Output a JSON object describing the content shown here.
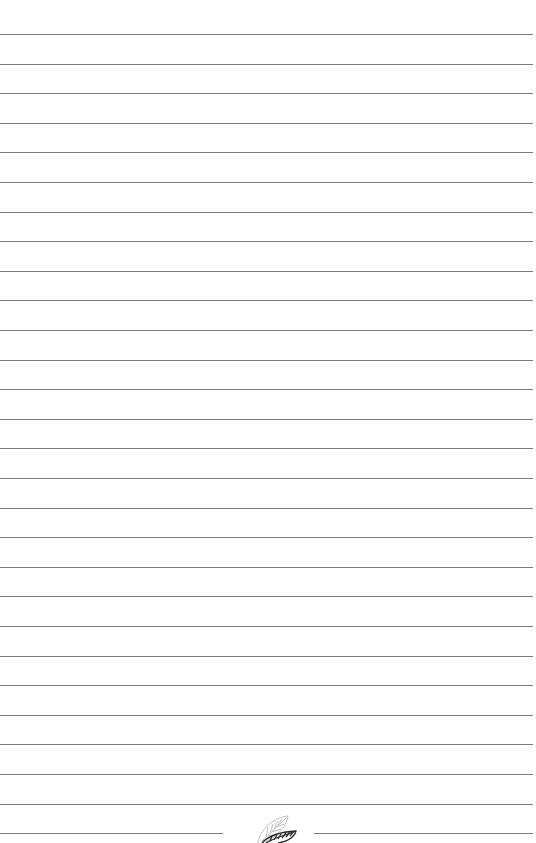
{
  "page": {
    "type": "lined-notebook-page",
    "background_color": "#ffffff",
    "line_color": "#7d7d7d",
    "line_count": 28,
    "line_spacing_px": 29.6,
    "first_line_y": 34
  },
  "ornament": {
    "icon": "leaf-icon",
    "position": "bottom-center"
  }
}
